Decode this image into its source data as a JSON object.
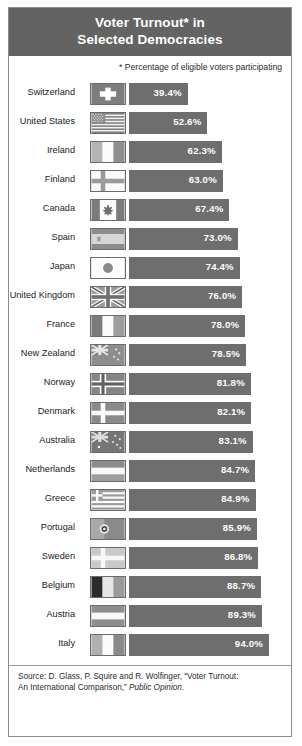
{
  "header": {
    "title_line1": "Voter Turnout* in",
    "title_line2": "Selected Democracies",
    "title_full": "Voter Turnout* in Selected Democracies"
  },
  "subtitle": "* Percentage of eligible voters participating",
  "source": {
    "line1": "Source: D. Glass, P. Squire and R. Wolfinger, “Voter Turnout:",
    "line2_prefix": "An International Comparison,” ",
    "line2_italic": "Public Opinion",
    "line2_suffix": "."
  },
  "colors": {
    "header_band": "#636363",
    "bar": "#6e6e6e",
    "bar_label": "#ffffff",
    "frame_border": "#8c8c8c",
    "text": "#1a1a1a",
    "page_background": "#ffffff"
  },
  "chart_data": {
    "type": "bar",
    "orientation": "horizontal",
    "title": "Voter Turnout* in Selected Democracies",
    "subtitle": "* Percentage of eligible voters participating",
    "xlabel": "",
    "ylabel": "",
    "xlim": [
      0,
      100
    ],
    "grid": false,
    "legend": false,
    "value_suffix": "%",
    "sorted": "ascending by value",
    "categories": [
      "Switzerland",
      "United States",
      "Ireland",
      "Finland",
      "Canada",
      "Spain",
      "Japan",
      "United Kingdom",
      "France",
      "New Zealand",
      "Norway",
      "Denmark",
      "Australia",
      "Netherlands",
      "Greece",
      "Portugal",
      "Sweden",
      "Belgium",
      "Austria",
      "Italy"
    ],
    "values": [
      39.4,
      52.6,
      62.3,
      63.0,
      67.4,
      73.0,
      74.4,
      76.0,
      78.0,
      78.5,
      81.8,
      82.1,
      83.1,
      84.7,
      84.9,
      85.9,
      86.8,
      88.7,
      89.3,
      94.0
    ],
    "value_labels": [
      "39.4%",
      "52.6%",
      "62.3%",
      "63.0%",
      "67.4%",
      "73.0%",
      "74.4%",
      "76.0%",
      "78.0%",
      "78.5%",
      "81.8%",
      "82.1%",
      "83.1%",
      "84.7%",
      "84.9%",
      "85.9%",
      "86.8%",
      "88.7%",
      "89.3%",
      "94.0%"
    ]
  },
  "rows": [
    {
      "country": "Switzerland",
      "value": 39.4,
      "label": "39.4%",
      "flag": "flag-switzerland"
    },
    {
      "country": "United States",
      "value": 52.6,
      "label": "52.6%",
      "flag": "flag-united-states"
    },
    {
      "country": "Ireland",
      "value": 62.3,
      "label": "62.3%",
      "flag": "flag-ireland"
    },
    {
      "country": "Finland",
      "value": 63.0,
      "label": "63.0%",
      "flag": "flag-finland"
    },
    {
      "country": "Canada",
      "value": 67.4,
      "label": "67.4%",
      "flag": "flag-canada"
    },
    {
      "country": "Spain",
      "value": 73.0,
      "label": "73.0%",
      "flag": "flag-spain"
    },
    {
      "country": "Japan",
      "value": 74.4,
      "label": "74.4%",
      "flag": "flag-japan"
    },
    {
      "country": "United Kingdom",
      "value": 76.0,
      "label": "76.0%",
      "flag": "flag-united-kingdom"
    },
    {
      "country": "France",
      "value": 78.0,
      "label": "78.0%",
      "flag": "flag-france"
    },
    {
      "country": "New Zealand",
      "value": 78.5,
      "label": "78.5%",
      "flag": "flag-new-zealand"
    },
    {
      "country": "Norway",
      "value": 81.8,
      "label": "81.8%",
      "flag": "flag-norway"
    },
    {
      "country": "Denmark",
      "value": 82.1,
      "label": "82.1%",
      "flag": "flag-denmark"
    },
    {
      "country": "Australia",
      "value": 83.1,
      "label": "83.1%",
      "flag": "flag-australia"
    },
    {
      "country": "Netherlands",
      "value": 84.7,
      "label": "84.7%",
      "flag": "flag-netherlands"
    },
    {
      "country": "Greece",
      "value": 84.9,
      "label": "84.9%",
      "flag": "flag-greece"
    },
    {
      "country": "Portugal",
      "value": 85.9,
      "label": "85.9%",
      "flag": "flag-portugal"
    },
    {
      "country": "Sweden",
      "value": 86.8,
      "label": "86.8%",
      "flag": "flag-sweden"
    },
    {
      "country": "Belgium",
      "value": 88.7,
      "label": "88.7%",
      "flag": "flag-belgium"
    },
    {
      "country": "Austria",
      "value": 89.3,
      "label": "89.3%",
      "flag": "flag-austria"
    },
    {
      "country": "Italy",
      "value": 94.0,
      "label": "94.0%",
      "flag": "flag-italy"
    }
  ]
}
